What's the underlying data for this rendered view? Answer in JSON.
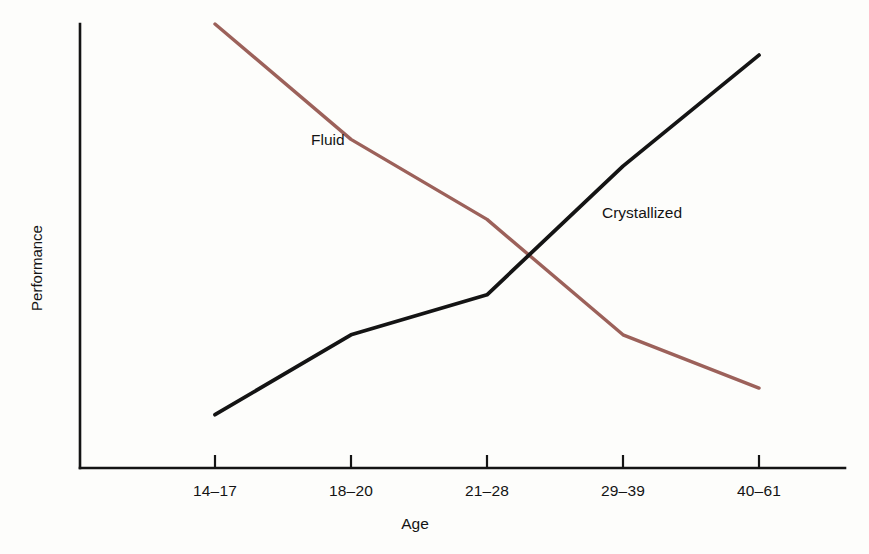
{
  "chart_data": {
    "type": "line",
    "title": "",
    "subtitle": "",
    "xlabel": "Age",
    "ylabel": "Performance",
    "categories": [
      "14–17",
      "18–20",
      "21–28",
      "29–39",
      "40–61"
    ],
    "grid": false,
    "legend_position": "inline-annotations",
    "axis_style": "open-left-bottom",
    "xlim_labels": [
      "14–17",
      "40–61"
    ],
    "ylim": [
      0,
      100
    ],
    "y_ticks": [],
    "series": [
      {
        "name": "Fluid",
        "color": "#9c615a",
        "annotation": "Fluid",
        "values": [
          100,
          74,
          56,
          30,
          18
        ],
        "points": [
          {
            "category": "14–17",
            "value": 100
          },
          {
            "category": "18–20",
            "value": 74
          },
          {
            "category": "21–28",
            "value": 56
          },
          {
            "category": "29–39",
            "value": 30
          },
          {
            "category": "40–61",
            "value": 18
          }
        ]
      },
      {
        "name": "Crystallized",
        "color": "#141414",
        "annotation": "Crystallized",
        "values": [
          12,
          30,
          39,
          68,
          93
        ],
        "points": [
          {
            "category": "14–17",
            "value": 12
          },
          {
            "category": "18–20",
            "value": 30
          },
          {
            "category": "21–28",
            "value": 39
          },
          {
            "category": "29–39",
            "value": 68
          },
          {
            "category": "40–61",
            "value": 93
          }
        ]
      }
    ],
    "annotations": [
      {
        "text": "Fluid",
        "near_series": "Fluid",
        "x_px": 311,
        "y_px": 139
      },
      {
        "text": "Crystallized",
        "near_series": "Crystallized",
        "x_px": 602,
        "y_px": 212
      }
    ]
  },
  "figure": {
    "background_color": "#fdfdfb",
    "axis_color": "#141414",
    "fluid_color": "#9c615a",
    "crystallized_color": "#141414"
  },
  "axes": {
    "x_title": "Age",
    "y_title": "Performance",
    "x_tick_labels": [
      "14–17",
      "18–20",
      "21–28",
      "29–39",
      "40–61"
    ]
  },
  "labels": {
    "fluid": "Fluid",
    "crystallized": "Crystallized"
  }
}
